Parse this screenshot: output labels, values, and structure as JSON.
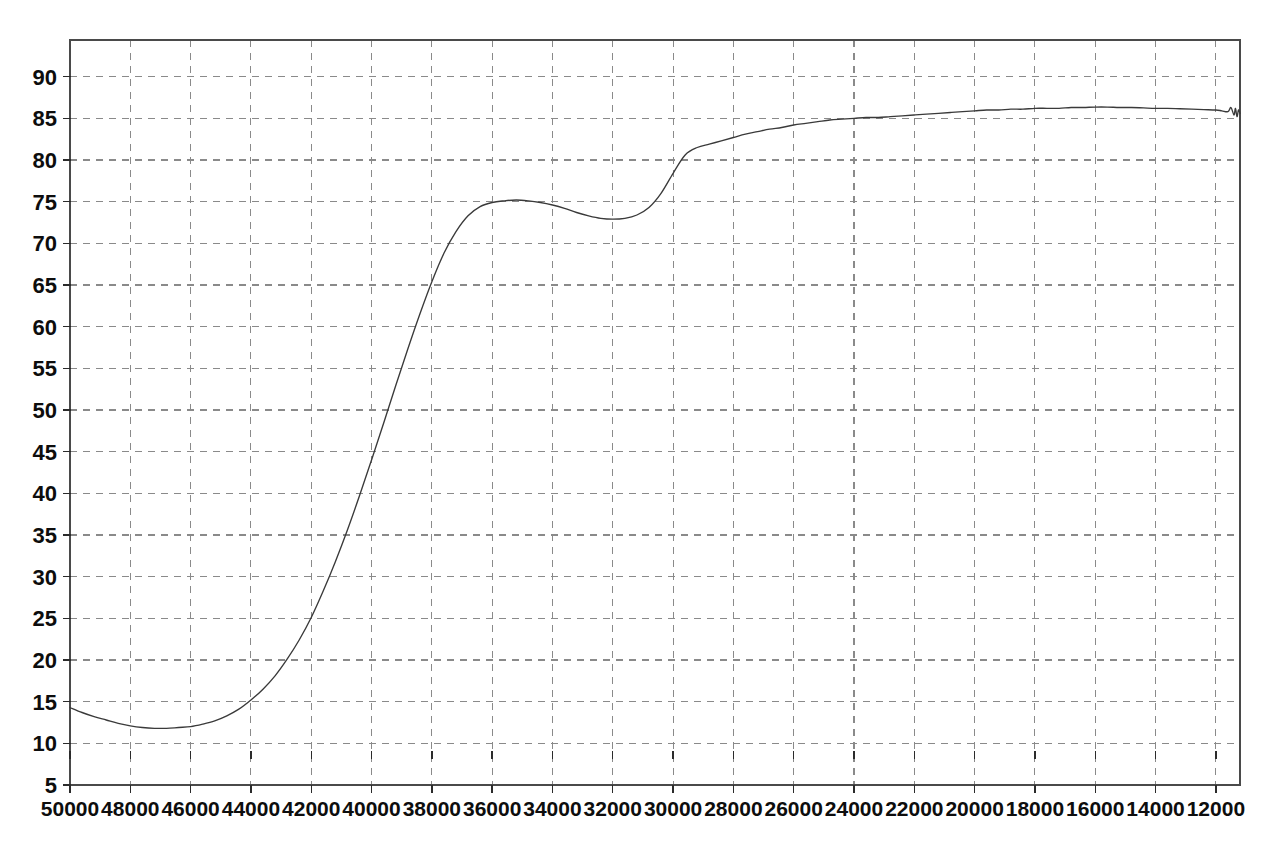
{
  "chart_data": {
    "type": "line",
    "title": "",
    "subtitle": "",
    "xlabel": "",
    "ylabel": "",
    "grid": true,
    "legend": null,
    "x_axis_reversed": true,
    "xlim": [
      50000,
      11200
    ],
    "ylim": [
      5,
      94.4
    ],
    "x_ticks": [
      50000,
      48000,
      46000,
      44000,
      42000,
      40000,
      38000,
      36000,
      34000,
      32000,
      30000,
      28000,
      26000,
      24000,
      22000,
      20000,
      18000,
      16000,
      14000,
      12000
    ],
    "x_tick_labels": [
      "50000",
      "48000",
      "46000",
      "44000",
      "42000",
      "40000",
      "38000",
      "36000",
      "34000",
      "32000",
      "30000",
      "28000",
      "26000",
      "24000",
      "22000",
      "20000",
      "18000",
      "16000",
      "14000",
      "12000"
    ],
    "y_ticks": [
      5,
      10,
      15,
      20,
      25,
      30,
      35,
      40,
      45,
      50,
      55,
      60,
      65,
      70,
      75,
      80,
      85,
      90
    ],
    "y_tick_labels": [
      "5",
      "10",
      "15",
      "20",
      "25",
      "30",
      "35",
      "40",
      "45",
      "50",
      "55",
      "60",
      "65",
      "70",
      "75",
      "80",
      "85",
      "90"
    ],
    "series": [
      {
        "name": "spectrum",
        "color": "#3a3a3a",
        "x": [
          50000,
          49600,
          49200,
          48800,
          48400,
          48000,
          47600,
          47200,
          46800,
          46400,
          46000,
          45600,
          45200,
          44800,
          44400,
          44000,
          43600,
          43200,
          42800,
          42400,
          42000,
          41600,
          41200,
          40800,
          40400,
          40000,
          39600,
          39200,
          38800,
          38400,
          38000,
          37600,
          37200,
          36800,
          36400,
          36000,
          35600,
          35200,
          34800,
          34400,
          34000,
          33600,
          33200,
          32800,
          32400,
          32000,
          31600,
          31200,
          30800,
          30400,
          30000,
          29600,
          29200,
          28800,
          28400,
          28000,
          27600,
          27200,
          26800,
          26400,
          26000,
          25600,
          25200,
          24800,
          24400,
          24000,
          23600,
          23200,
          22800,
          22400,
          22000,
          21600,
          21200,
          20800,
          20400,
          20000,
          19600,
          19200,
          18800,
          18400,
          18000,
          17600,
          17200,
          16800,
          16400,
          16000,
          15600,
          15200,
          14800,
          14400,
          14000,
          13600,
          13200,
          12800,
          12400,
          12000,
          11800,
          11600,
          11500,
          11400,
          11350,
          11300,
          11250,
          11200
        ],
        "y": [
          14.3,
          13.7,
          13.2,
          12.8,
          12.4,
          12.1,
          11.9,
          11.8,
          11.8,
          11.9,
          12.0,
          12.3,
          12.7,
          13.3,
          14.1,
          15.2,
          16.5,
          18.1,
          20.1,
          22.4,
          25.1,
          28.3,
          31.8,
          35.6,
          39.7,
          44.0,
          48.4,
          52.9,
          57.3,
          61.5,
          65.4,
          68.8,
          71.4,
          73.3,
          74.4,
          74.9,
          75.1,
          75.2,
          75.1,
          74.9,
          74.6,
          74.2,
          73.7,
          73.3,
          73.0,
          72.9,
          73.0,
          73.4,
          74.3,
          76.0,
          78.4,
          80.6,
          81.5,
          81.9,
          82.3,
          82.7,
          83.1,
          83.4,
          83.7,
          83.9,
          84.2,
          84.4,
          84.6,
          84.8,
          84.9,
          85.0,
          85.1,
          85.1,
          85.2,
          85.3,
          85.4,
          85.5,
          85.6,
          85.7,
          85.8,
          85.9,
          86.0,
          86.0,
          86.1,
          86.1,
          86.2,
          86.2,
          86.2,
          86.3,
          86.3,
          86.35,
          86.35,
          86.3,
          86.3,
          86.25,
          86.2,
          86.2,
          86.15,
          86.1,
          86.05,
          86.0,
          85.9,
          85.8,
          86.3,
          85.4,
          86.2,
          85.2,
          86.0,
          85.6
        ]
      }
    ]
  },
  "axis": {
    "frame_color": "#4a4a4a",
    "grid_color": "#8a8a8a",
    "tick_color": "#2b2b2b"
  },
  "page": {
    "background": "#ffffff"
  }
}
